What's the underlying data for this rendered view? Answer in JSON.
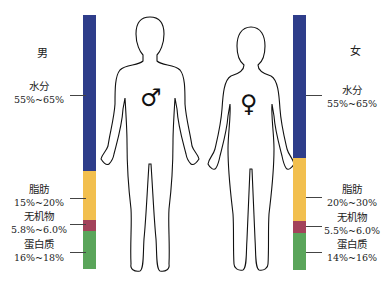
{
  "colors": {
    "water": "#2e3d8a",
    "fat": "#f2bf4e",
    "minerals": "#a3425a",
    "protein": "#5aa55a"
  },
  "male": {
    "title": "男",
    "symbol": "♂",
    "components": [
      {
        "name": "水分",
        "range": "55%~65%"
      },
      {
        "name": "脂肪",
        "range": "15%~20%"
      },
      {
        "name": "无机物",
        "range": "5.8%~6.0%"
      },
      {
        "name": "蛋白质",
        "range": "16%~18%"
      }
    ]
  },
  "female": {
    "title": "女",
    "symbol": "♀",
    "components": [
      {
        "name": "水分",
        "range": "55%~65%"
      },
      {
        "name": "脂肪",
        "range": "20%~30%"
      },
      {
        "name": "无机物",
        "range": "5.5%~6.0%"
      },
      {
        "name": "蛋白质",
        "range": "14%~16%"
      }
    ]
  }
}
